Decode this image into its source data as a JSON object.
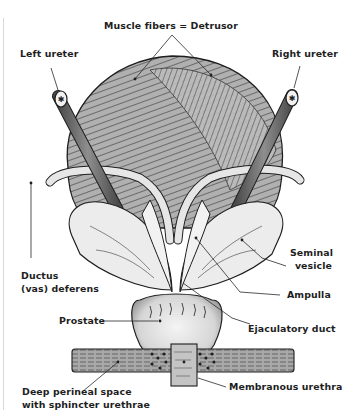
{
  "diagram": {
    "labels": {
      "muscle_fibers": "Muscle fibers = Detrusor",
      "left_ureter": "Left ureter",
      "right_ureter": "Right ureter",
      "seminal_vesicle_line1": "Seminal",
      "seminal_vesicle_line2": "vesicle",
      "ductus_line1": "Ductus",
      "ductus_line2": "(vas) deferens",
      "ampulla": "Ampulla",
      "prostate": "Prostate",
      "ejaculatory_duct": "Ejaculatory duct",
      "membranous_urethra": "Membranous urethra",
      "deep_perineal_line1": "Deep perineal space",
      "deep_perineal_line2": "with sphincter urethrae"
    },
    "colors": {
      "background": "#ffffff",
      "ink": "#1e1e1e",
      "bladder_fill": "#9a9a9a",
      "vesicle_fill": "#ececec",
      "ureter_fill": "#6e6e6e",
      "prostate_fill": "#e2e2e2",
      "membrane_fill": "#b4b4b4"
    }
  }
}
